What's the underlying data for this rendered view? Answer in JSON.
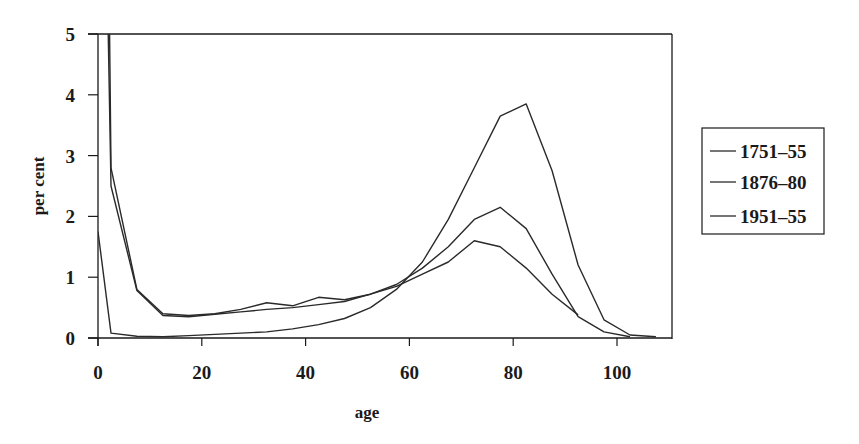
{
  "chart_data": {
    "type": "line",
    "title": "",
    "xlabel": "age",
    "ylabel": "per cent",
    "xlim": [
      0,
      110
    ],
    "ylim": [
      0,
      5
    ],
    "x_ticks": [
      0,
      20,
      40,
      60,
      80,
      100
    ],
    "y_ticks": [
      0,
      1,
      2,
      3,
      4,
      5
    ],
    "grid": false,
    "legend_position": "right",
    "series": [
      {
        "name": "1751-55",
        "x": [
          0,
          2.5,
          7.5,
          12.5,
          17.5,
          22.5,
          27.5,
          32.5,
          37.5,
          42.5,
          47.5,
          52.5,
          57.5,
          62.5,
          67.5,
          72.5,
          77.5,
          82.5,
          87.5,
          92.5
        ],
        "values": [
          5,
          2.8,
          0.8,
          0.4,
          0.37,
          0.4,
          0.47,
          0.58,
          0.53,
          0.67,
          0.63,
          0.72,
          0.85,
          1.05,
          1.25,
          1.6,
          1.5,
          1.15,
          0.72,
          0.38
        ]
      },
      {
        "name": "1876-80",
        "x": [
          0,
          2.5,
          7.5,
          12.5,
          17.5,
          22.5,
          27.5,
          32.5,
          37.5,
          42.5,
          47.5,
          52.5,
          57.5,
          62.5,
          67.5,
          72.5,
          77.5,
          82.5,
          87.5,
          92.5,
          97.5,
          102.5
        ],
        "values": [
          5,
          2.5,
          0.78,
          0.37,
          0.35,
          0.39,
          0.43,
          0.47,
          0.5,
          0.55,
          0.6,
          0.72,
          0.88,
          1.15,
          1.5,
          1.95,
          2.15,
          1.8,
          1.05,
          0.35,
          0.1,
          0.02
        ]
      },
      {
        "name": "1951-55",
        "x": [
          0,
          2.5,
          7.5,
          12.5,
          17.5,
          22.5,
          27.5,
          32.5,
          37.5,
          42.5,
          47.5,
          52.5,
          57.5,
          62.5,
          67.5,
          72.5,
          77.5,
          82.5,
          87.5,
          92.5,
          97.5,
          102.5,
          107.5
        ],
        "values": [
          1.75,
          0.08,
          0.03,
          0.02,
          0.04,
          0.06,
          0.08,
          0.1,
          0.15,
          0.22,
          0.32,
          0.5,
          0.8,
          1.25,
          1.95,
          2.8,
          3.65,
          3.85,
          2.75,
          1.2,
          0.3,
          0.05,
          0.02
        ]
      }
    ]
  },
  "legend": {
    "items": [
      {
        "label": "1751–55"
      },
      {
        "label": "1876–80"
      },
      {
        "label": "1951–55"
      }
    ]
  },
  "axes": {
    "x_title": "age",
    "y_title": "per cent",
    "x_tick_labels": [
      "0",
      "20",
      "40",
      "60",
      "80",
      "100"
    ],
    "y_tick_labels": [
      "0",
      "1",
      "2",
      "3",
      "4",
      "5"
    ]
  },
  "colors": {
    "line": "#2a2a2a",
    "axis": "#1a1a1a",
    "background": "#ffffff"
  }
}
